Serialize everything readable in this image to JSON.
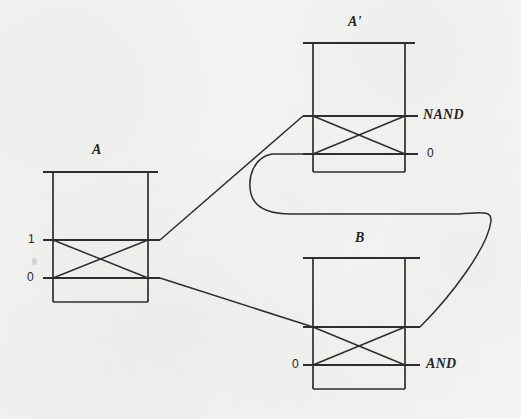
{
  "figure": {
    "kind": "crossbar-latch-logic-diagram",
    "background_color": "#f4f4f3",
    "ink_color": "#2e2e30",
    "width": 521,
    "height": 419
  },
  "gates": [
    {
      "id": "gate-a",
      "name": "A",
      "name_x": 96,
      "name_y": 150,
      "box": {
        "left": 53,
        "right": 148,
        "top": 172,
        "bottom": 302
      },
      "top_bar": {
        "x1": 43,
        "x2": 158,
        "y": 172
      },
      "rails": [
        {
          "id": "a-rail-upper",
          "y": 240,
          "x1": 43,
          "x2": 160,
          "label": "1",
          "label_x": 30,
          "label_y": 240,
          "label_side": "left"
        },
        {
          "id": "a-rail-lower",
          "y": 278,
          "x1": 43,
          "x2": 160,
          "label": "0",
          "label_x": 30,
          "label_y": 278,
          "label_side": "left"
        }
      ],
      "crossbar": {
        "x1": 53,
        "x2": 148,
        "y_top": 240,
        "y_bottom": 278
      }
    },
    {
      "id": "gate-a-prime",
      "name": "A'",
      "name_x": 352,
      "name_y": 22,
      "box": {
        "left": 313,
        "right": 405,
        "top": 43,
        "bottom": 172
      },
      "top_bar": {
        "x1": 303,
        "x2": 415,
        "y": 43
      },
      "rails": [
        {
          "id": "ap-rail-upper",
          "y": 116,
          "x1": 303,
          "x2": 418,
          "label": "NAND",
          "label_x": 423,
          "label_y": 116,
          "label_side": "right"
        },
        {
          "id": "ap-rail-lower",
          "y": 154,
          "x1": 303,
          "x2": 418,
          "label": "0",
          "label_x": 426,
          "label_y": 154,
          "label_side": "right"
        }
      ],
      "crossbar": {
        "x1": 313,
        "x2": 405,
        "y_top": 116,
        "y_bottom": 154
      }
    },
    {
      "id": "gate-b",
      "name": "B",
      "name_x": 358,
      "name_y": 238,
      "box": {
        "left": 313,
        "right": 405,
        "top": 258,
        "bottom": 389
      },
      "top_bar": {
        "x1": 303,
        "x2": 420,
        "y": 258
      },
      "rails": [
        {
          "id": "b-rail-upper",
          "y": 327,
          "x1": 303,
          "x2": 420,
          "label": "",
          "label_x": 0,
          "label_y": 0,
          "label_side": "none"
        },
        {
          "id": "b-rail-lower",
          "y": 365,
          "x1": 303,
          "x2": 420,
          "label": "0",
          "label_x": 294,
          "label_y": 365,
          "label_side": "left"
        }
      ],
      "crossbar": {
        "x1": 313,
        "x2": 405,
        "y_top": 327,
        "y_bottom": 365
      },
      "output": {
        "label": "AND",
        "label_x": 427,
        "label_y": 365
      }
    }
  ],
  "wires": [
    {
      "id": "wire-a-upper-to-aprime-upper",
      "from": "gate-a.a-rail-upper",
      "to": "gate-a-prime.ap-rail-upper",
      "path": "M 160 240 L 303 116"
    },
    {
      "id": "wire-a-lower-to-b-upper",
      "from": "gate-a.a-rail-lower",
      "to": "gate-b.b-rail-upper",
      "path": "M 160 278 L 313 327"
    },
    {
      "id": "wire-feedback-aprime-lower-to-b-upper",
      "from": "gate-a-prime.ap-rail-lower",
      "to": "gate-b.b-rail-upper",
      "path": "M 303 154 L 272 154 C 254 158 248 178 252 195 C 256 210 272 215 292 215 L 452 215 C 482 215 494 210 492 222 C 488 246 452 294 420 327"
    }
  ],
  "labels": {
    "gate_a": "A",
    "gate_a_prime": "A'",
    "gate_b": "B",
    "a_input_upper": "1",
    "a_input_lower": "0",
    "aprime_output_upper": "NAND",
    "aprime_output_lower": "0",
    "b_input_lower": "0",
    "b_output": "AND"
  }
}
